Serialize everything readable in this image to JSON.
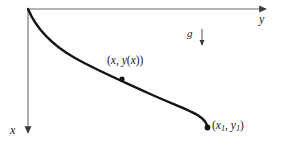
{
  "figure": {
    "background_color": "#ffffff",
    "axis_color": "#999999",
    "curve_color": "#141414",
    "text_color": "#1a1a1a"
  },
  "axes": {
    "origin": {
      "x": 28,
      "y": 9
    },
    "y_axis": {
      "label": "y",
      "orientation": "horizontal-right",
      "start": {
        "x": 28,
        "y": 9
      },
      "end": {
        "x": 268,
        "y": 9
      },
      "arrowhead": "right"
    },
    "x_axis": {
      "label": "x",
      "orientation": "vertical-down",
      "start": {
        "x": 28,
        "y": 9
      },
      "end": {
        "x": 28,
        "y": 136
      },
      "arrowhead": "down"
    }
  },
  "gravity": {
    "label": "g",
    "arrow": {
      "start": {
        "x": 202,
        "y": 29
      },
      "end": {
        "x": 202,
        "y": 48
      },
      "arrowhead": "down"
    }
  },
  "curve": {
    "name": "brachistochrone",
    "stroke_width": 2.4,
    "path": "M 28 9 C 36 28, 52 45, 75 58 C 98 71, 120 80, 148 93 C 172 104, 190 110, 199 116 C 205 120, 207 124, 207.5 127.5",
    "points": [
      {
        "x": 28,
        "y": 9
      },
      {
        "x": 45,
        "y": 26
      },
      {
        "x": 60,
        "y": 38
      },
      {
        "x": 80,
        "y": 56
      },
      {
        "x": 100,
        "y": 67
      },
      {
        "x": 122,
        "y": 79
      },
      {
        "x": 150,
        "y": 93
      },
      {
        "x": 175,
        "y": 105
      },
      {
        "x": 192,
        "y": 112
      },
      {
        "x": 202,
        "y": 120
      },
      {
        "x": 207.5,
        "y": 127.5
      }
    ]
  },
  "markers": [
    {
      "name": "generic-point",
      "x": 122,
      "y": 79,
      "radius": 2.6,
      "label_parts": {
        "open": "(",
        "var1": "x",
        "comma": ", ",
        "var2": "y",
        "open2": "(",
        "var3": "x",
        "close2": ")",
        "close": ")"
      },
      "label_text": "(x, y(x))"
    },
    {
      "name": "end-point",
      "x": 207.5,
      "y": 127.5,
      "radius": 2.8,
      "label_parts": {
        "open": "(",
        "var1": "x",
        "sub1": "1",
        "comma": ", ",
        "var2": "y",
        "sub2": "1",
        "close": ")"
      },
      "label_text": "(x1, y1)"
    }
  ]
}
